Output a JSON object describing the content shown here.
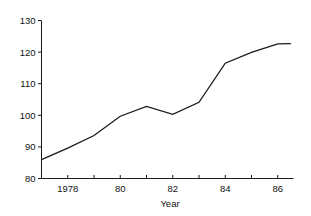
{
  "chart_data": {
    "type": "line",
    "title": "",
    "subtitle": "",
    "xlabel": "Year",
    "ylabel": "",
    "xlim": [
      1977,
      1986.6
    ],
    "ylim": [
      80,
      130
    ],
    "grid": false,
    "legend": null,
    "accent_color": "#1a1a1a",
    "background_color": "#ffffff",
    "y_ticks": [
      80,
      90,
      100,
      110,
      120,
      130
    ],
    "y_tick_labels": [
      "80",
      "90",
      "100",
      "110",
      "120",
      "130"
    ],
    "x_ticks": [
      1977,
      1978,
      1979,
      1980,
      1981,
      1982,
      1983,
      1984,
      1985,
      1986
    ],
    "x_tick_labels": [
      "",
      "1978",
      "",
      "80",
      "",
      "82",
      "",
      "84",
      "",
      "86"
    ],
    "x": [
      1977,
      1978,
      1979,
      1980,
      1981,
      1982,
      1983,
      1984,
      1985,
      1986,
      1986.5
    ],
    "values": [
      86.0,
      89.6,
      93.6,
      99.7,
      102.8,
      100.3,
      104.1,
      116.5,
      119.9,
      122.6,
      122.7
    ],
    "series": [
      {
        "name": "index",
        "values": [
          86.0,
          89.6,
          93.6,
          99.7,
          102.8,
          100.3,
          104.1,
          116.5,
          119.9,
          122.6,
          122.7
        ]
      }
    ],
    "annotations": []
  },
  "axes": {
    "x_title": "Year",
    "y_title": ""
  }
}
